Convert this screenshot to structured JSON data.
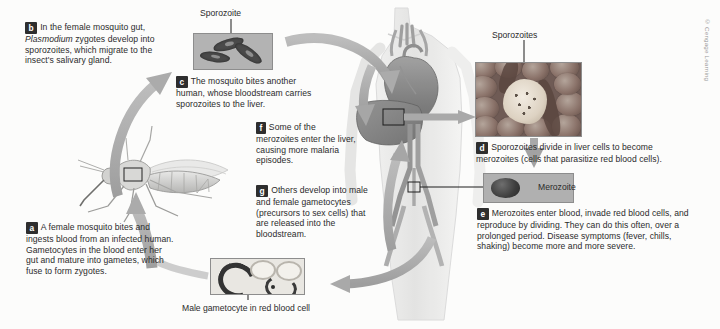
{
  "figure": {
    "copyright": "© Cengage Learning"
  },
  "steps": [
    {
      "id": "a",
      "tag": "a",
      "text": "A female mosquito bites and ingests blood from an infected human. Gametocytes in the blood enter her gut and mature into gametes, which fuse to form zygotes."
    },
    {
      "id": "b",
      "tag": "b",
      "text_before": "In the female mosquito gut,",
      "italic": "Plasmodium",
      "text_after": "zygotes develop into sporozoites, which migrate to the insect's salivary gland."
    },
    {
      "id": "c",
      "tag": "c",
      "text": "The mosquito bites another human, whose bloodstream carries sporozoites to the liver."
    },
    {
      "id": "d",
      "tag": "d",
      "text": "Sporozoites divide in liver cells to become merozoites (cells that parasitize red blood cells)."
    },
    {
      "id": "e",
      "tag": "e",
      "text": "Merozoites enter blood, invade red blood cells, and reproduce by dividing. They can do this often, over a prolonged period. Disease symptoms (fever, chills, shaking) become more and more severe."
    },
    {
      "id": "f",
      "tag": "f",
      "text": "Some of the merozoites enter the liver, causing more malaria episodes."
    },
    {
      "id": "g",
      "tag": "g",
      "text": "Others develop into male and female gametocytes (precursors to sex cells) that are released into the bloodstream."
    }
  ],
  "captions": {
    "sporozoite_single": "Sporozoite",
    "sporozoites_plural": "Sporozoites",
    "merozoite": "Merozoite",
    "male_gametocyte": "Male gametocyte in red blood cell"
  },
  "colors": {
    "arrow": "#a9a9a9",
    "tag_background": "#2e2e2e",
    "tag_text": "#ffffff",
    "text": "#2b2b2b",
    "panel_border": "#8d8d8d"
  }
}
